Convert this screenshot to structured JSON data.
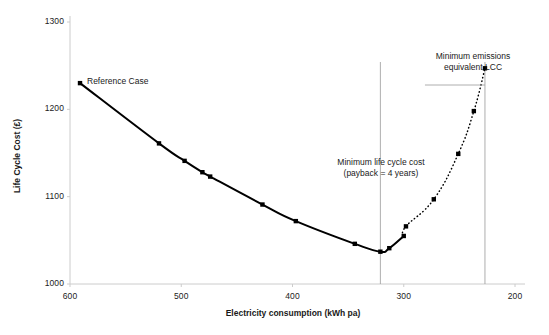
{
  "chart_data": {
    "type": "line",
    "title": "",
    "xlabel": "Electricity consumption (kWh pa)",
    "ylabel": "Life Cycle Cost (£)",
    "xlim": [
      600,
      200
    ],
    "ylim": [
      1000,
      1300
    ],
    "x_ticks": [
      600,
      500,
      400,
      300,
      200
    ],
    "y_ticks": [
      1000,
      1100,
      1200,
      1300
    ],
    "x_axis_reversed": true,
    "grid": false,
    "legend": "none",
    "series": [
      {
        "name": "Life cycle cost curve (measured)",
        "style": "solid",
        "marker": "square",
        "color": "#000000",
        "points": [
          {
            "x": 591,
            "y": 1230
          },
          {
            "x": 520,
            "y": 1161
          },
          {
            "x": 497,
            "y": 1141
          },
          {
            "x": 481,
            "y": 1128
          },
          {
            "x": 474,
            "y": 1123
          },
          {
            "x": 427,
            "y": 1091
          },
          {
            "x": 397,
            "y": 1072
          },
          {
            "x": 344,
            "y": 1046
          },
          {
            "x": 321,
            "y": 1037
          },
          {
            "x": 313,
            "y": 1041
          },
          {
            "x": 300,
            "y": 1055
          }
        ]
      },
      {
        "name": "Life cycle cost curve (extrapolated)",
        "style": "dotted",
        "marker": "square",
        "color": "#000000",
        "points": [
          {
            "x": 300,
            "y": 1055
          },
          {
            "x": 298,
            "y": 1066
          },
          {
            "x": 273,
            "y": 1097
          },
          {
            "x": 251,
            "y": 1149
          },
          {
            "x": 237,
            "y": 1198
          },
          {
            "x": 227,
            "y": 1247
          }
        ]
      }
    ],
    "annotations": [
      {
        "id": "reference-case",
        "text": "Reference Case",
        "x": 591,
        "y": 1230
      },
      {
        "id": "min-lcc",
        "line1": "Minimum life cycle cost",
        "line2": "(payback = 4 years)",
        "x": 321
      },
      {
        "id": "min-emissions",
        "line1": "Minimum emissions",
        "line2": "equivalent LCC",
        "x": 227
      }
    ],
    "reference_lines": [
      {
        "id": "min-lcc-vline",
        "orientation": "vertical",
        "x": 321,
        "color": "#999999"
      },
      {
        "id": "min-emissions-vline",
        "orientation": "vertical",
        "x": 227,
        "color": "#999999"
      }
    ],
    "colors": {
      "curve": "#000000",
      "axis": "#cccccc",
      "reference_line": "#999999",
      "background": "#ffffff"
    }
  },
  "axis": {
    "y_tick_labels": [
      "1300",
      "1200",
      "1100",
      "1000"
    ],
    "x_tick_labels": [
      "600",
      "500",
      "400",
      "300",
      "200"
    ],
    "y_title": "Life Cycle Cost (£)",
    "x_title": "Electricity consumption (kWh pa)"
  },
  "annotations": {
    "reference_case": "Reference Case",
    "min_lcc_line1": "Minimum life cycle cost",
    "min_lcc_line2": "(payback = 4 years)",
    "min_emissions_line1": "Minimum emissions",
    "min_emissions_line2": "equivalent LCC"
  }
}
